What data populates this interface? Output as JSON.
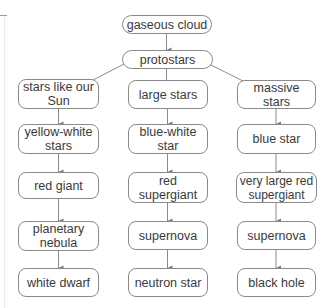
{
  "diagram": {
    "title": "",
    "root": {
      "id": "gaseous_cloud",
      "label": "gaseous cloud"
    },
    "level1": {
      "id": "protostars",
      "label": "protostars"
    },
    "columns": [
      {
        "id": "sun_like",
        "nodes": [
          {
            "label": "stars like our Sun"
          },
          {
            "label": "yellow-white stars"
          },
          {
            "label": "red giant"
          },
          {
            "label": "planetary nebula"
          },
          {
            "label": "white dwarf"
          }
        ]
      },
      {
        "id": "large",
        "nodes": [
          {
            "label": "large stars"
          },
          {
            "label": "blue-white star"
          },
          {
            "label": "red supergiant"
          },
          {
            "label": "supernova"
          },
          {
            "label": "neutron star"
          }
        ]
      },
      {
        "id": "massive",
        "nodes": [
          {
            "label": "massive stars"
          },
          {
            "label": "blue star"
          },
          {
            "label": "very large red supergiant"
          },
          {
            "label": "supernova"
          },
          {
            "label": "black hole"
          }
        ]
      }
    ],
    "edges": [
      [
        "gaseous cloud",
        "protostars"
      ],
      [
        "protostars",
        "stars like our Sun"
      ],
      [
        "protostars",
        "large stars"
      ],
      [
        "protostars",
        "massive stars"
      ],
      [
        "stars like our Sun",
        "yellow-white stars"
      ],
      [
        "yellow-white stars",
        "red giant"
      ],
      [
        "red giant",
        "planetary nebula"
      ],
      [
        "planetary nebula",
        "white dwarf"
      ],
      [
        "large stars",
        "blue-white star"
      ],
      [
        "blue-white star",
        "red supergiant"
      ],
      [
        "red supergiant",
        "supernova"
      ],
      [
        "supernova",
        "neutron star"
      ],
      [
        "massive stars",
        "blue star"
      ],
      [
        "blue star",
        "very large red supergiant"
      ],
      [
        "very large red supergiant",
        "supernova"
      ],
      [
        "supernova",
        "black hole"
      ]
    ],
    "colors": {
      "border": "#8a8a8a",
      "text": "#3a3a3a",
      "arrow": "#7a7a7a",
      "background": "#ffffff"
    }
  }
}
